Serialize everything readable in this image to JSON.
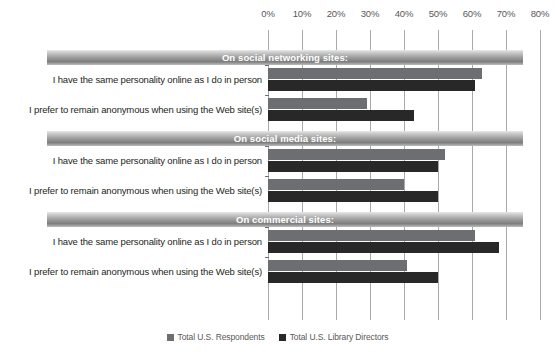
{
  "chart_data": {
    "type": "bar",
    "orientation": "horizontal",
    "title": "",
    "xlabel": "",
    "ylabel": "",
    "xlim": [
      0,
      80
    ],
    "xticks": [
      "0%",
      "10%",
      "20%",
      "30%",
      "40%",
      "50%",
      "60%",
      "70%",
      "80%"
    ],
    "xtick_values": [
      0,
      10,
      20,
      30,
      40,
      50,
      60,
      70,
      80
    ],
    "grid": true,
    "legend_position": "bottom",
    "series": [
      {
        "name": "Total U.S. Respondents",
        "color": "#6d6e71"
      },
      {
        "name": "Total U.S. Library Directors",
        "color": "#282828"
      }
    ],
    "groups": [
      {
        "header": "On social networking sites:",
        "categories": [
          "I have the same personality online as I do in person",
          "I prefer to remain anonymous when using the Web site(s)"
        ],
        "values": [
          [
            63,
            61
          ],
          [
            29,
            43
          ]
        ]
      },
      {
        "header": "On social media sites:",
        "categories": [
          "I have the same personality online as I do in person",
          "I prefer to remain anonymous when using the Web site(s)"
        ],
        "values": [
          [
            52,
            50
          ],
          [
            40,
            50
          ]
        ]
      },
      {
        "header": "On commercial sites:",
        "categories": [
          "I have the same personality online as I do in person",
          "I prefer to remain anonymous when using the Web site(s)"
        ],
        "values": [
          [
            61,
            68
          ],
          [
            41,
            50
          ]
        ]
      }
    ]
  },
  "colors": {
    "series0": "#6d6e71",
    "series1": "#282828",
    "gridline": "#a7a9ac",
    "band_text": "#ffffff",
    "label_text": "#231f20",
    "tick_text": "#58595b"
  }
}
